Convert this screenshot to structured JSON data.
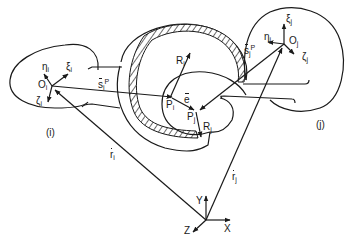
{
  "diagram": {
    "type": "revolute joint kinematics",
    "bodies": [
      {
        "id": "i",
        "label": "(i)",
        "origin": "O_i",
        "axes": [
          "ξ_i",
          "η_i",
          "ζ_i"
        ]
      },
      {
        "id": "j",
        "label": "(j)",
        "origin": "O_j",
        "axes": [
          "ξ_j",
          "η_j",
          "ζ_j"
        ]
      }
    ],
    "labels": {
      "body_i": "(i)",
      "body_j": "(j)",
      "origin_i": "O",
      "origin_i_sub": "i",
      "origin_j": "O",
      "origin_j_sub": "j",
      "xi": "ξ",
      "eta": "η",
      "zeta": "ζ",
      "sub_i": "i",
      "sub_j": "j",
      "s_vec": "s",
      "sup_P": "P",
      "r_vec": "r",
      "R": "R",
      "P": "P",
      "e_vec": "e",
      "global_x": "X",
      "global_y": "Y",
      "global_z": "Z"
    },
    "vectors": [
      "s_i^P",
      "s_j^P",
      "r_i",
      "r_j",
      "R_i",
      "R_j",
      "e"
    ],
    "colors": {
      "stroke": "#1a1a1a",
      "background": "#ffffff"
    }
  }
}
